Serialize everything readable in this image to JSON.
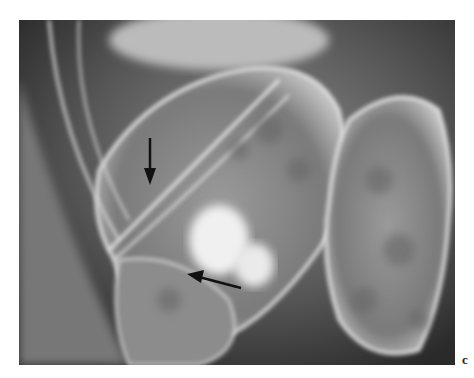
{
  "figure": {
    "panel_label": "c",
    "annotations": [
      {
        "type": "arrow",
        "direction": "down",
        "tip": [
          150,
          183
        ]
      },
      {
        "type": "arrow",
        "direction": "left",
        "tip": [
          187,
          272
        ]
      }
    ]
  }
}
